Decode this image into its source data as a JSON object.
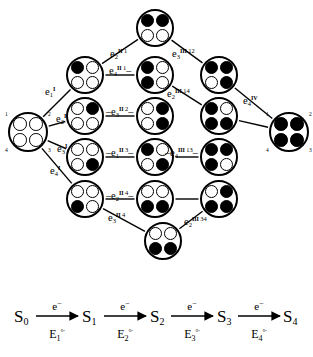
{
  "figure": {
    "node_site_labels": [
      "1",
      "2",
      "3",
      "4"
    ],
    "nodes": [
      {
        "id": "S0",
        "name": "cluster-s0-all-empty",
        "x": 8,
        "y": 112,
        "r": 20,
        "sites": [
          0,
          0,
          0,
          0
        ],
        "show_site_numbers": true
      },
      {
        "id": "S1-1",
        "name": "cluster-s1-site1",
        "x": 66,
        "y": 56,
        "r": 19,
        "sites": [
          1,
          0,
          0,
          0
        ],
        "show_site_numbers": false
      },
      {
        "id": "S1-2",
        "name": "cluster-s1-site2",
        "x": 66,
        "y": 97,
        "r": 19,
        "sites": [
          0,
          1,
          0,
          0
        ],
        "show_site_numbers": false
      },
      {
        "id": "S1-3",
        "name": "cluster-s1-site3",
        "x": 66,
        "y": 138,
        "r": 19,
        "sites": [
          0,
          0,
          1,
          0
        ],
        "show_site_numbers": false
      },
      {
        "id": "S1-4",
        "name": "cluster-s1-site4",
        "x": 66,
        "y": 180,
        "r": 19,
        "sites": [
          0,
          0,
          0,
          1
        ],
        "show_site_numbers": false
      },
      {
        "id": "S2-12",
        "name": "cluster-s2-sites12",
        "x": 136,
        "y": 9,
        "r": 19,
        "sites": [
          1,
          1,
          0,
          0
        ],
        "show_site_numbers": false
      },
      {
        "id": "S2-14",
        "name": "cluster-s2-sites14",
        "x": 136,
        "y": 56,
        "r": 19,
        "sites": [
          1,
          0,
          0,
          1
        ],
        "show_site_numbers": false
      },
      {
        "id": "S2-23",
        "name": "cluster-s2-sites23",
        "x": 136,
        "y": 97,
        "r": 19,
        "sites": [
          0,
          1,
          1,
          0
        ],
        "show_site_numbers": false
      },
      {
        "id": "S2-13",
        "name": "cluster-s2-sites13",
        "x": 136,
        "y": 138,
        "r": 19,
        "sites": [
          1,
          0,
          1,
          0
        ],
        "show_site_numbers": false
      },
      {
        "id": "S2-34",
        "name": "cluster-s2-sites34",
        "x": 136,
        "y": 180,
        "r": 19,
        "sites": [
          0,
          0,
          1,
          1
        ],
        "show_site_numbers": false
      },
      {
        "id": "S2-34b",
        "name": "cluster-s2-sites34-lower",
        "x": 144,
        "y": 222,
        "r": 19,
        "sites": [
          0,
          0,
          1,
          1
        ],
        "show_site_numbers": false
      },
      {
        "id": "S3-123",
        "name": "cluster-s3-sites123",
        "x": 200,
        "y": 56,
        "r": 19,
        "sites": [
          1,
          1,
          1,
          0
        ],
        "show_site_numbers": false
      },
      {
        "id": "S3-134",
        "name": "cluster-s3-sites134",
        "x": 200,
        "y": 97,
        "r": 19,
        "sites": [
          1,
          0,
          1,
          1
        ],
        "show_site_numbers": false
      },
      {
        "id": "S3-124",
        "name": "cluster-s3-sites124",
        "x": 200,
        "y": 138,
        "r": 19,
        "sites": [
          1,
          1,
          0,
          1
        ],
        "show_site_numbers": false
      },
      {
        "id": "S3-234",
        "name": "cluster-s3-sites234",
        "x": 200,
        "y": 180,
        "r": 19,
        "sites": [
          0,
          1,
          1,
          1
        ],
        "show_site_numbers": false
      },
      {
        "id": "S4",
        "name": "cluster-s4-all-filled",
        "x": 269,
        "y": 112,
        "r": 20,
        "sites": [
          1,
          1,
          1,
          1
        ],
        "show_site_numbers": true
      }
    ],
    "edges": [
      {
        "from": "S0",
        "to": "S1-1"
      },
      {
        "from": "S0",
        "to": "S1-2"
      },
      {
        "from": "S0",
        "to": "S1-3"
      },
      {
        "from": "S0",
        "to": "S1-4"
      },
      {
        "from": "S1-1",
        "to": "S2-12"
      },
      {
        "from": "S1-1",
        "to": "S2-14"
      },
      {
        "from": "S1-2",
        "to": "S2-23"
      },
      {
        "from": "S1-3",
        "to": "S2-13"
      },
      {
        "from": "S1-4",
        "to": "S2-34"
      },
      {
        "from": "S1-4",
        "to": "S2-34b"
      },
      {
        "from": "S2-12",
        "to": "S3-123"
      },
      {
        "from": "S2-14",
        "to": "S3-134"
      },
      {
        "from": "S2-13",
        "to": "S3-124"
      },
      {
        "from": "S2-34",
        "to": "S3-234"
      },
      {
        "from": "S2-34b",
        "to": "S3-234"
      },
      {
        "from": "S3-123",
        "to": "S4"
      },
      {
        "from": "S3-134",
        "to": "S4"
      }
    ],
    "edge_labels": [
      {
        "name": "edge-label-e1-I",
        "base": "e",
        "sub": "1",
        "roman": "I",
        "num": "",
        "x": 45,
        "y": 86,
        "lead_dash": false,
        "trail_dash": false
      },
      {
        "name": "edge-label-e2-I",
        "base": "e",
        "sub": "2",
        "roman": "I",
        "num": "",
        "x": 56,
        "y": 113,
        "lead_dash": false,
        "trail_dash": false
      },
      {
        "name": "edge-label-e3-I",
        "base": "e",
        "sub": "3",
        "roman": "I",
        "num": "",
        "x": 57,
        "y": 143,
        "lead_dash": false,
        "trail_dash": false
      },
      {
        "name": "edge-label-e4-I",
        "base": "e",
        "sub": "4",
        "roman": "I",
        "num": "",
        "x": 50,
        "y": 165,
        "lead_dash": false,
        "trail_dash": false
      },
      {
        "name": "edge-label-e2-II-1",
        "base": "e",
        "sub": "2",
        "roman": "II",
        "num": "1",
        "x": 110,
        "y": 48,
        "lead_dash": false,
        "trail_dash": false
      },
      {
        "name": "edge-label-e4-II-1",
        "base": "e",
        "sub": "4",
        "roman": "II",
        "num": "1",
        "x": 109,
        "y": 65,
        "lead_dash": false,
        "trail_dash": true
      },
      {
        "name": "edge-label-e3-II-2",
        "base": "e",
        "sub": "3",
        "roman": "II",
        "num": "2",
        "x": 106,
        "y": 106,
        "lead_dash": true,
        "trail_dash": true
      },
      {
        "name": "edge-label-e1-II-3",
        "base": "e",
        "sub": "1",
        "roman": "II",
        "num": "3",
        "x": 106,
        "y": 147,
        "lead_dash": true,
        "trail_dash": true
      },
      {
        "name": "edge-label-e2-II-4",
        "base": "e",
        "sub": "2",
        "roman": "II",
        "num": "4",
        "x": 106,
        "y": 190,
        "lead_dash": true,
        "trail_dash": true
      },
      {
        "name": "edge-label-e3-II-4",
        "base": "e",
        "sub": "3",
        "roman": "II",
        "num": "4",
        "x": 108,
        "y": 212,
        "lead_dash": false,
        "trail_dash": false
      },
      {
        "name": "edge-label-e3-III-12",
        "base": "e",
        "sub": "3",
        "roman": "III",
        "num": "12",
        "x": 172,
        "y": 48,
        "lead_dash": false,
        "trail_dash": false
      },
      {
        "name": "edge-label-e2-III-14",
        "base": "e",
        "sub": "2",
        "roman": "III",
        "num": "14",
        "x": 167,
        "y": 88,
        "lead_dash": false,
        "trail_dash": false
      },
      {
        "name": "edge-label-e4-III-13",
        "base": "e",
        "sub": "4",
        "roman": "III",
        "num": "13",
        "x": 165,
        "y": 147,
        "lead_dash": true,
        "trail_dash": true
      },
      {
        "name": "edge-label-e2-III-34",
        "base": "e",
        "sub": "2",
        "roman": "III",
        "num": "34",
        "x": 184,
        "y": 216,
        "lead_dash": false,
        "trail_dash": false
      },
      {
        "name": "edge-label-e4-IV",
        "base": "e",
        "sub": "4",
        "roman": "IV",
        "num": "",
        "x": 243,
        "y": 95,
        "lead_dash": false,
        "trail_dash": false
      }
    ]
  },
  "scheme": {
    "name": "redox-reaction-scheme",
    "species": [
      {
        "label": "S",
        "sub": "0",
        "x": 14
      },
      {
        "label": "S",
        "sub": "1",
        "x": 82
      },
      {
        "label": "S",
        "sub": "2",
        "x": 150
      },
      {
        "label": "S",
        "sub": "3",
        "x": 217
      },
      {
        "label": "S",
        "sub": "4",
        "x": 283
      }
    ],
    "steps": [
      {
        "electron": "e",
        "electron_charge": "−",
        "potential": "E",
        "potential_sub": "1",
        "potential_sup": "°′",
        "x": 36
      },
      {
        "electron": "e",
        "electron_charge": "−",
        "potential": "E",
        "potential_sub": "2",
        "potential_sup": "°′",
        "x": 104
      },
      {
        "electron": "e",
        "electron_charge": "−",
        "potential": "E",
        "potential_sub": "3",
        "potential_sup": "°′",
        "x": 171
      },
      {
        "electron": "e",
        "electron_charge": "−",
        "potential": "E",
        "potential_sub": "4",
        "potential_sup": "°′",
        "x": 238
      }
    ]
  },
  "colors": {
    "ink": "#000000",
    "paper": "#ffffff"
  }
}
